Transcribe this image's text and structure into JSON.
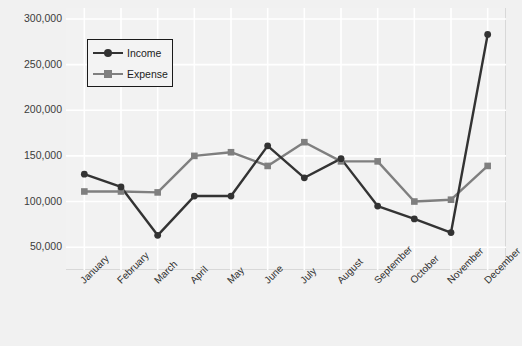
{
  "chart_data": {
    "type": "line",
    "title": "",
    "xlabel": "",
    "ylabel": "",
    "categories": [
      "January",
      "February",
      "March",
      "April",
      "May",
      "June",
      "July",
      "August",
      "September",
      "October",
      "November",
      "December"
    ],
    "series": [
      {
        "name": "Income",
        "color": "#333333",
        "marker": "circle",
        "values": [
          130000,
          116000,
          63000,
          106000,
          106000,
          161000,
          126000,
          147000,
          95000,
          81000,
          66000,
          283000
        ]
      },
      {
        "name": "Expense",
        "color": "#7f7f7f",
        "marker": "square",
        "values": [
          111000,
          111000,
          110000,
          150000,
          154000,
          139000,
          165000,
          144000,
          144000,
          100000,
          102000,
          139000
        ]
      }
    ],
    "ylim": [
      25000,
      312000
    ],
    "yticks": [
      50000,
      100000,
      150000,
      200000,
      250000,
      300000
    ],
    "ytick_labels": [
      "50,000",
      "100,000",
      "150,000",
      "200,000",
      "250,000",
      "300,000"
    ],
    "grid": true,
    "grid_color": "#ffffff",
    "legend_position": "upper left",
    "legend_entries": [
      "Income",
      "Expense"
    ],
    "plot_background": "#f2f2f2",
    "figure_background": "#f1f1f1"
  }
}
